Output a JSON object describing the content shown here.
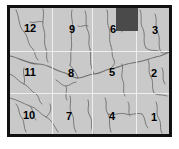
{
  "map": {
    "title": "Numbered zone map with drainage network",
    "frame": {
      "x": 7,
      "y": 5,
      "width": 165,
      "height": 132,
      "border_color": "#111111",
      "border_width": 3
    },
    "background_color": "#c9c9c9",
    "grid": {
      "line_color": "#f2f2f2",
      "vertical_x": [
        42,
        82,
        126
      ],
      "horizontal_y": [
        43,
        85
      ]
    },
    "highlight": {
      "name": "dark-patch",
      "color": "#4a4a4a",
      "x": 106,
      "y": 1,
      "width": 22,
      "height": 23
    },
    "river_color": "#707070",
    "zones": [
      {
        "id": "12",
        "label": "12",
        "x": 30,
        "y": 28
      },
      {
        "id": "9",
        "label": "9",
        "x": 72,
        "y": 29
      },
      {
        "id": "6",
        "label": "6",
        "x": 113,
        "y": 29
      },
      {
        "id": "3",
        "label": "3",
        "x": 155,
        "y": 30
      },
      {
        "id": "11",
        "label": "11",
        "x": 30,
        "y": 72
      },
      {
        "id": "8",
        "label": "8",
        "x": 71,
        "y": 73
      },
      {
        "id": "5",
        "label": "5",
        "x": 112,
        "y": 72
      },
      {
        "id": "2",
        "label": "2",
        "x": 154,
        "y": 73
      },
      {
        "id": "10",
        "label": "10",
        "x": 29,
        "y": 115
      },
      {
        "id": "7",
        "label": "7",
        "x": 69,
        "y": 116
      },
      {
        "id": "4",
        "label": "4",
        "x": 112,
        "y": 116
      },
      {
        "id": "1",
        "label": "1",
        "x": 154,
        "y": 117
      }
    ]
  }
}
